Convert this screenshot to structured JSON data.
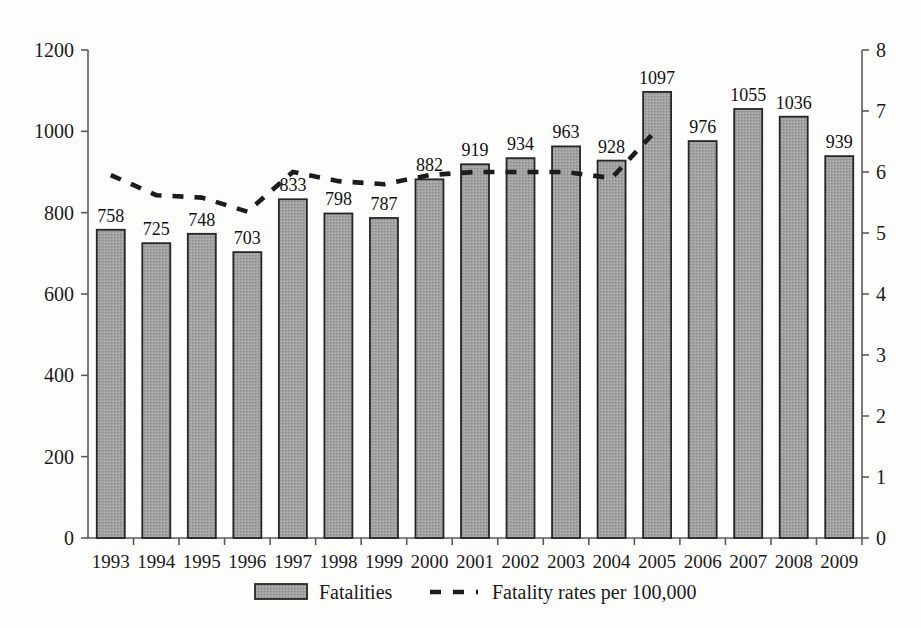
{
  "chart_data": {
    "type": "bar",
    "title": "",
    "xlabel": "",
    "ylabel": "",
    "categories": [
      "1993",
      "1994",
      "1995",
      "1996",
      "1997",
      "1998",
      "1999",
      "2000",
      "2001",
      "2002",
      "2003",
      "2004",
      "2005",
      "2006",
      "2007",
      "2008",
      "2009"
    ],
    "ylim": [
      0,
      1200
    ],
    "y_ticks": [
      "0",
      "200",
      "400",
      "600",
      "800",
      "1000",
      "1200"
    ],
    "y2lim": [
      0,
      8
    ],
    "y2_ticks": [
      "0",
      "1",
      "2",
      "3",
      "4",
      "5",
      "6",
      "7",
      "8"
    ],
    "grid": false,
    "legend_position": "bottom",
    "series": [
      {
        "name": "Fatalities",
        "kind": "bar",
        "axis": "left",
        "values": [
          758,
          725,
          748,
          703,
          833,
          798,
          787,
          882,
          919,
          934,
          963,
          928,
          1097,
          976,
          1055,
          1036,
          939
        ],
        "labels": [
          "758",
          "725",
          "748",
          "703",
          "833",
          "798",
          "787",
          "882",
          "919",
          "934",
          "963",
          "928",
          "1097",
          "976",
          "1055",
          "1036",
          "939"
        ],
        "fill_color": "#9a9a9a",
        "border_color": "#262626"
      },
      {
        "name": "Fatality rates per 100,000",
        "kind": "dashed-line",
        "axis": "right",
        "x": [
          "1993",
          "1994",
          "1995",
          "1996",
          "1997",
          "1998",
          "1999",
          "2000",
          "2001",
          "2002",
          "2003",
          "2004",
          "2005"
        ],
        "values": [
          5.95,
          5.62,
          5.58,
          5.35,
          6.0,
          5.85,
          5.8,
          5.95,
          6.0,
          6.0,
          6.0,
          5.9,
          6.7
        ],
        "line_color": "#1c1c1c"
      }
    ]
  },
  "legend": {
    "items": [
      {
        "label": "Fatalities",
        "marker": "filled-rect-swatch"
      },
      {
        "label": "Fatality rates per 100,000",
        "marker": "dashed-line-swatch"
      }
    ]
  },
  "colors": {
    "background": "#fdfdfb",
    "axis": "#5a5a5a",
    "text": "#1a1a1a",
    "bar_fill": "#9a9a9a",
    "bar_border": "#262626",
    "line": "#1c1c1c"
  }
}
